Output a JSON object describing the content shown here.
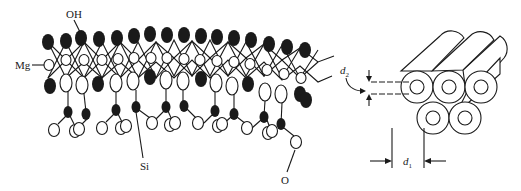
{
  "figure": {
    "left_panel": {
      "description": "Chrysotile (serpentine) sheet structure",
      "labels": {
        "oh": "OH",
        "mg": "Mg",
        "si": "Si",
        "o": "O"
      },
      "legend_semantics": {
        "filled_large_oval": "OH",
        "open_small_circle": "Mg",
        "open_oval": "O",
        "filled_small_oval": "Si"
      }
    },
    "right_panel": {
      "description": "Bundle of hollow nanotube fibers",
      "tube_count": 5,
      "rows": [
        3,
        2
      ],
      "labels": {
        "d2_main": "d",
        "d2_sub": "2",
        "d1_main": "d",
        "d1_sub": "1"
      },
      "dimension_meaning": {
        "d1": "outer diameter",
        "d2": "inner diameter"
      }
    },
    "colors": {
      "ink": "#1a1a1a",
      "background": "#ffffff"
    }
  }
}
